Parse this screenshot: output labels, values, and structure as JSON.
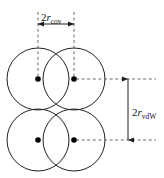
{
  "figure": {
    "type": "molecular-radii-diagram",
    "width": 164,
    "height": 178,
    "background_color": "#ffffff",
    "stroke_color": "#231f20",
    "dash_color": "#58595b",
    "dot_color": "#000000"
  },
  "labels": {
    "covalent": {
      "number": "2",
      "variable": "r",
      "subscript": "cov",
      "full": "2r_cov"
    },
    "vdw": {
      "number": "2",
      "variable": "r",
      "subscript": "vdW",
      "full": "2r_vdW"
    }
  },
  "geometry": {
    "circle_radius": 31,
    "atoms": [
      {
        "name": "atom-top-left",
        "cx": 38,
        "cy": 79
      },
      {
        "name": "atom-top-right",
        "cx": 74,
        "cy": 79
      },
      {
        "name": "atom-bottom-left",
        "cx": 38,
        "cy": 140
      },
      {
        "name": "atom-bottom-right",
        "cx": 74,
        "cy": 140
      }
    ],
    "nucleus_dot_radius": 2.8,
    "covalent_dimension": {
      "y": 24,
      "x_start": 38,
      "x_end": 74,
      "extension_top": 12,
      "extension_bottom": 79
    },
    "vdw_dimension": {
      "x": 128,
      "y_start": 79,
      "y_end": 140,
      "lead_x_start": 76,
      "lead_x_end": 156
    }
  }
}
